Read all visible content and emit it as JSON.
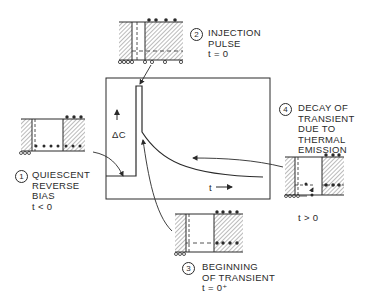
{
  "diagram": {
    "type": "dlts-capacitance-transient",
    "colors": {
      "ink": "#2a2a2a",
      "background": "#ffffff"
    },
    "graph": {
      "y_label": "ΔC",
      "x_label": "t"
    },
    "stages": [
      {
        "number": "1",
        "lines": [
          "QUIESCENT",
          "REVERSE",
          "BIAS"
        ],
        "condition": "t < 0"
      },
      {
        "number": "2",
        "lines": [
          "INJECTION",
          "PULSE"
        ],
        "condition": "t = 0"
      },
      {
        "number": "3",
        "lines": [
          "BEGINNING",
          "OF TRANSIENT"
        ],
        "condition": "t = 0⁺"
      },
      {
        "number": "4",
        "lines": [
          "DECAY OF",
          "TRANSIENT",
          "DUE TO",
          "THERMAL",
          "EMISSION"
        ],
        "condition": "t > 0"
      }
    ]
  }
}
